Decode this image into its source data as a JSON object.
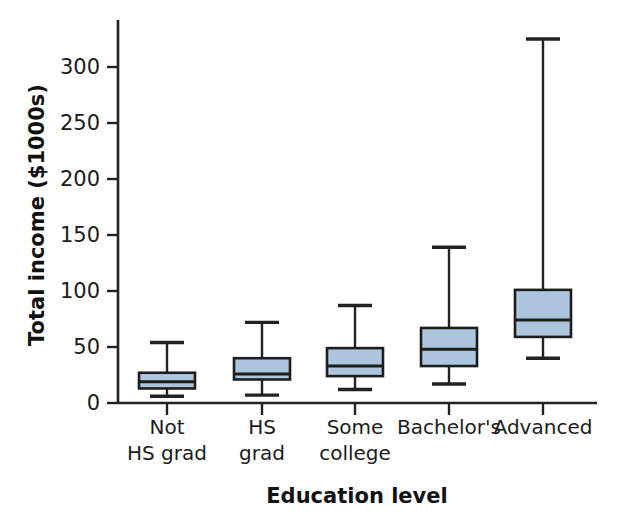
{
  "chart_data": {
    "type": "box",
    "title": "",
    "xlabel": "Education level",
    "ylabel": "Total income ($1000s)",
    "categories": [
      "Not\nHS grad",
      "HS\ngrad",
      "Some\ncollege",
      "Bachelor's",
      "Advanced"
    ],
    "category_lines": [
      [
        "Not",
        "HS grad"
      ],
      [
        "HS",
        "grad"
      ],
      [
        "Some",
        "college"
      ],
      [
        "Bachelor's",
        ""
      ],
      [
        "Advanced",
        ""
      ]
    ],
    "ylim": [
      0,
      330
    ],
    "yticks": [
      0,
      50,
      100,
      150,
      200,
      250,
      300
    ],
    "ytick_labels": [
      "0",
      "50",
      "100",
      "150",
      "200",
      "250",
      "300"
    ],
    "grid": false,
    "legend": "none",
    "box_fill_color": "#aec5de",
    "box_edge_color": "#1d1d1d",
    "boxes": [
      {
        "category": "Not HS grad",
        "whisker_low": 6,
        "q1": 13,
        "median": 19,
        "q3": 27,
        "whisker_high": 54
      },
      {
        "category": "HS grad",
        "whisker_low": 7,
        "q1": 21,
        "median": 26,
        "q3": 40,
        "whisker_high": 72
      },
      {
        "category": "Some college",
        "whisker_low": 12,
        "q1": 24,
        "median": 33,
        "q3": 49,
        "whisker_high": 87
      },
      {
        "category": "Bachelor's",
        "whisker_low": 17,
        "q1": 33,
        "median": 48,
        "q3": 67,
        "whisker_high": 139
      },
      {
        "category": "Advanced",
        "whisker_low": 40,
        "q1": 59,
        "median": 74,
        "q3": 101,
        "whisker_high": 325
      }
    ]
  },
  "labels": {
    "ylabel": "Total income ($1000s)",
    "xlabel": "Education level"
  }
}
